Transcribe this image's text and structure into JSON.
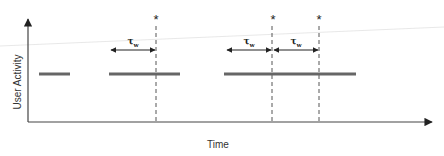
{
  "diagram": {
    "y_axis_label": "User Activity",
    "x_axis_label": "Time",
    "interval_symbol": "τ",
    "interval_subscript": "w",
    "event_marker": "*",
    "activity_segments": [
      {
        "x_start": 39,
        "x_end": 70
      },
      {
        "x_start": 109,
        "x_end": 180
      },
      {
        "x_start": 224,
        "x_end": 356
      }
    ],
    "event_times": [
      156,
      272,
      319
    ],
    "intervals": [
      {
        "x_start": 110,
        "x_end": 156,
        "label": "τw"
      },
      {
        "x_start": 226,
        "x_end": 272,
        "label": "τw"
      },
      {
        "x_start": 273,
        "x_end": 319,
        "label": "τw"
      }
    ],
    "colors": {
      "axis": "#444444",
      "segment": "#666666",
      "dashed": "#555555",
      "arrow": "#222222"
    }
  }
}
